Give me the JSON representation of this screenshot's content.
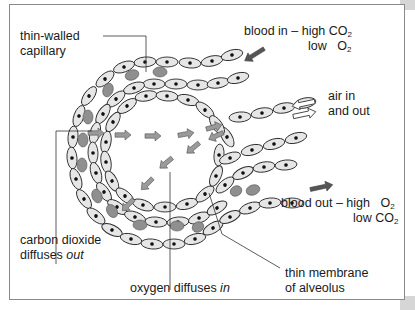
{
  "diagram": {
    "labels": {
      "capillary_line1": "thin-walled",
      "capillary_line2": "capillary",
      "blood_in_line1_prefix": "blood in – high CO",
      "blood_in_line1_sub": "2",
      "blood_in_line2_prefix": "low",
      "blood_in_line2_o": "O",
      "blood_in_line2_sub": "2",
      "air_line1": "air in",
      "air_line2": "and out",
      "blood_out_line1_prefix": "blood out – high",
      "blood_out_line1_o": "O",
      "blood_out_line1_sub": "2",
      "blood_out_line2_prefix": "low CO",
      "blood_out_line2_sub": "2",
      "co2_line1": "carbon dioxide",
      "co2_line2_prefix": "diffuses ",
      "co2_line2_em": "out",
      "o2_prefix": "oxygen diffuses ",
      "o2_em": "in",
      "membrane_line1": "thin membrane",
      "membrane_line2": "of alveolus"
    },
    "icons": {
      "blood_in_arrow": "arrow-down-left-dark",
      "blood_out_arrow": "arrow-right-dark",
      "air_arrows": "double-hollow-arrows",
      "diffusion_arrows": "arrow-gray"
    },
    "colors": {
      "cell_fill": "#e6e6e6",
      "cell_stroke": "#2a2a2a",
      "nucleus": "#111111",
      "red_blood_cell": "#8f8f8f",
      "diffusion_arrow": "#9a9a9a",
      "flow_arrow": "#555555",
      "frame": "#8a8a8a"
    }
  }
}
